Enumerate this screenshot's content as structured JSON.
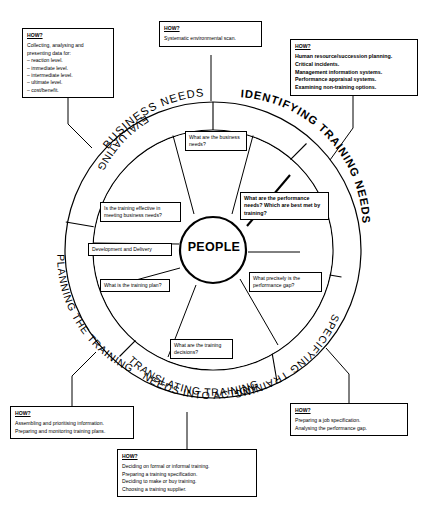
{
  "diagram": {
    "centre_label": "PEOPLE",
    "ring_labels": {
      "top": "BUSINESS NEEDS",
      "upper_right": "IDENTIFYING TRAINING NEEDS",
      "lower_right": "SPECIFYING TRAINING NEEDS",
      "bottom_line1": "TRANSLATING TRAINING",
      "bottom_line2": "NEEDS INTO ACTION",
      "lower_left": "PLANNING THE TRAINING",
      "upper_left": "EVALUATING THE TRAINING"
    },
    "inner_boxes": {
      "business_needs": "What are the business needs?",
      "performance_needs_line1": "What are the performance needs?",
      "performance_needs_line2": "Which are best met by training?",
      "effective": "Is the training effective in meeting business needs?",
      "development_delivery": "Development and Delivery",
      "training_plan": "What is the training plan?",
      "training_decisions": "What are the training decisions?",
      "performance_gap": "What precisely is the performance gap?"
    },
    "how_boxes": {
      "evaluating": {
        "heading": "HOW?",
        "lines": [
          "Collecting, analysing and",
          "presenting data for:",
          "– reaction level.",
          "– immediate level.",
          "– intermediate level.",
          "– ultimate level.",
          "– cost/benefit."
        ]
      },
      "business_needs": {
        "heading": "HOW?",
        "lines": [
          "Systematic environmental scan."
        ]
      },
      "identifying": {
        "heading": "HOW?",
        "lines": [
          "Human resource/succession planning.",
          "Critical incidents.",
          "Management information systems.",
          "Performance appraisal systems.",
          "Examining non-training options."
        ]
      },
      "planning": {
        "heading": "HOW?",
        "lines": [
          "Assembling and prioritising information.",
          "Preparing and monitoring training plans."
        ]
      },
      "translating": {
        "heading": "HOW?",
        "lines": [
          "Deciding on formal or informal training.",
          "Preparing a training specification.",
          "Deciding to make or buy training.",
          "Choosing a training supplier."
        ]
      },
      "specifying": {
        "heading": "HOW?",
        "lines": [
          "Preparing a job specification.",
          "Analysing the performance gap."
        ]
      }
    },
    "colors": {
      "stroke": "#000000",
      "background": "#ffffff"
    }
  }
}
